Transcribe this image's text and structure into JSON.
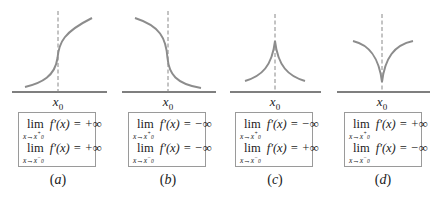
{
  "panels": [
    {
      "id": "a",
      "caption": "a",
      "x_label": "x",
      "x_label_sub": "0",
      "curve": "increasing with vertical tangent at x0",
      "limits": [
        {
          "func": "lim",
          "expr": "f′(x) = +∞",
          "approach": "x→x",
          "side_sup": "+",
          "sub0": "0"
        },
        {
          "func": "lim",
          "expr": "f′(x) = +∞",
          "approach": "x→x",
          "side_sup": "−",
          "sub0": "0"
        }
      ]
    },
    {
      "id": "b",
      "caption": "b",
      "x_label": "x",
      "x_label_sub": "0",
      "curve": "decreasing with vertical tangent at x0",
      "limits": [
        {
          "func": "lim",
          "expr": "f′(x) = −∞",
          "approach": "x→x",
          "side_sup": "+",
          "sub0": "0"
        },
        {
          "func": "lim",
          "expr": "f′(x) = −∞",
          "approach": "x→x",
          "side_sup": "−",
          "sub0": "0"
        }
      ]
    },
    {
      "id": "c",
      "caption": "c",
      "x_label": "x",
      "x_label_sub": "0",
      "curve": "cusp pointing up at x0",
      "limits": [
        {
          "func": "lim",
          "expr": "f′(x) = −∞",
          "approach": "x→x",
          "side_sup": "+",
          "sub0": "0"
        },
        {
          "func": "lim",
          "expr": "f′(x) = +∞",
          "approach": "x→x",
          "side_sup": "−",
          "sub0": "0"
        }
      ]
    },
    {
      "id": "d",
      "caption": "d",
      "x_label": "x",
      "x_label_sub": "0",
      "curve": "cusp pointing down at x0",
      "limits": [
        {
          "func": "lim",
          "expr": "f′(x) = +∞",
          "approach": "x→x",
          "side_sup": "+",
          "sub0": "0"
        },
        {
          "func": "lim",
          "expr": "f′(x) = −∞",
          "approach": "x→x",
          "side_sup": "−",
          "sub0": "0"
        }
      ]
    }
  ],
  "colors": {
    "curve": "#8c8c8c",
    "axis": "#555555",
    "dashed_line": "#888888",
    "box_border": "#9a9a9a",
    "text": "#222222"
  }
}
